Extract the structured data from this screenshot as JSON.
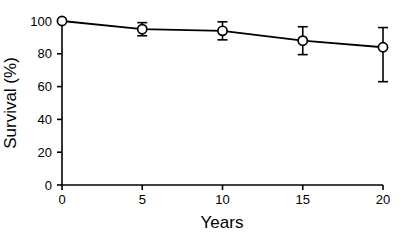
{
  "chart_data": {
    "type": "line",
    "title": "",
    "subtitle": "",
    "xlabel": "Years",
    "ylabel": "Survival (%)",
    "x": [
      0,
      5,
      10,
      15,
      20
    ],
    "values": [
      100,
      95,
      94,
      88,
      84
    ],
    "series": [
      {
        "name": "Survival",
        "values": [
          100,
          95,
          94,
          88,
          84
        ],
        "err_low": [
          0,
          4,
          5.5,
          8.5,
          21
        ],
        "err_high": [
          0,
          4,
          5.5,
          8.5,
          12
        ]
      }
    ],
    "xlim": [
      0,
      20
    ],
    "ylim": [
      0,
      100
    ],
    "xticks": [
      0,
      5,
      10,
      15,
      20
    ],
    "yticks": [
      0,
      20,
      40,
      60,
      80,
      100
    ],
    "xtick_labels": [
      "0",
      "5",
      "10",
      "15",
      "20"
    ],
    "ytick_labels": [
      "0",
      "20",
      "40",
      "60",
      "80",
      "100"
    ],
    "grid": false,
    "legend": false,
    "legend_position": "none",
    "marker": "open-circle",
    "line_color": "#000000",
    "marker_face_color": "#ffffff",
    "marker_edge_color": "#000000",
    "background_color": "#ffffff",
    "annotations": []
  },
  "axes": {
    "x_title": "Years",
    "y_title": "Survival (%)"
  }
}
